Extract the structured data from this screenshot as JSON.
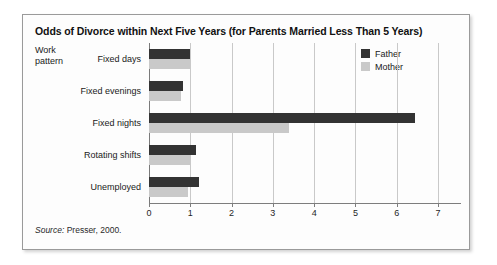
{
  "figure": {
    "title": "Odds of Divorce within Next Five Years (for Parents Married Less Than 5 Years)",
    "group_axis_label": "Work\npattern",
    "group_axis_label_line1": "Work",
    "group_axis_label_line2": "pattern",
    "source_keyword": "Source:",
    "source_text": " Presser, 2000."
  },
  "colors": {
    "father": "#333333",
    "mother": "#c9c9c9",
    "gridline": "#c9c9c9",
    "axis": "#7d7d7d",
    "frame_border": "#9a9a9a",
    "background": "#fdfdfd"
  },
  "legend": {
    "position": "top-right",
    "entries": [
      {
        "label": "Father",
        "color": "#333333"
      },
      {
        "label": "Mother",
        "color": "#c9c9c9"
      }
    ]
  },
  "chart_data": {
    "type": "bar",
    "orientation": "horizontal",
    "title": "Odds of Divorce within Next Five Years (for Parents Married Less Than 5 Years)",
    "xlabel": "",
    "ylabel": "Work pattern",
    "xlim": [
      0,
      7
    ],
    "xticks": [
      0,
      1,
      2,
      3,
      4,
      5,
      6,
      7
    ],
    "xtick_labels": [
      "0",
      "1",
      "2",
      "3",
      "4",
      "5",
      "6",
      "7"
    ],
    "grid": true,
    "grid_axis": "x",
    "legend_position": "top-right",
    "categories": [
      "Fixed days",
      "Fixed evenings",
      "Fixed nights",
      "Rotating shifts",
      "Unemployed"
    ],
    "series": [
      {
        "name": "Father",
        "color": "#333333",
        "values": [
          1.0,
          0.83,
          6.45,
          1.15,
          1.2
        ]
      },
      {
        "name": "Mother",
        "color": "#c9c9c9",
        "values": [
          1.0,
          0.78,
          3.4,
          1.0,
          0.95
        ]
      }
    ],
    "source": "Source: Presser, 2000."
  }
}
